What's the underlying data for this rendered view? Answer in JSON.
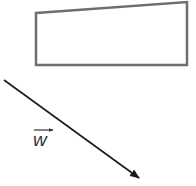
{
  "figure": {
    "background": "#ffffff",
    "shapes": [
      {
        "type": "quadrilateral",
        "name": "trapezoid",
        "points": [
          [
            36,
            13
          ],
          [
            187,
            2
          ],
          [
            187,
            65
          ],
          [
            36,
            65
          ]
        ],
        "stroke": "#6e6e6e",
        "stroke_width": 2.5,
        "fill": "none"
      }
    ],
    "vectors": [
      {
        "name": "w",
        "from": [
          4,
          80
        ],
        "to": [
          139,
          178
        ],
        "stroke": "#1a1a1a",
        "stroke_width": 1.6,
        "label": {
          "text": "w",
          "has_overarrow": true,
          "position": [
            31,
            126
          ]
        }
      }
    ]
  }
}
